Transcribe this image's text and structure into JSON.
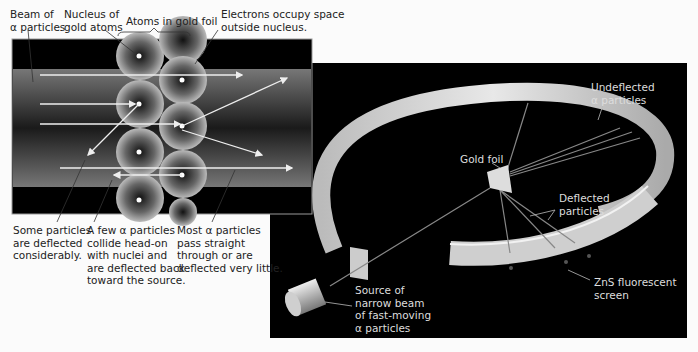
{
  "left_panel": {
    "labels": {
      "beam": "Beam of\nα particles",
      "nucleus": "Nucleus of\ngold atoms",
      "atoms": "Atoms in gold foil",
      "electrons": "Electrons occupy space\noutside nucleus.",
      "some_deflected": "Some particles\nare deflected\nconsiderably.",
      "few_collide": "A few α particles\ncollide head-on\nwith nuclei and\nare deflected back\ntoward the source.",
      "most_pass": "Most α particles\npass straight\nthrough or are\ndeflected very little."
    }
  },
  "right_panel": {
    "labels": {
      "undeflected": "Undeflected\nα particles",
      "gold_foil": "Gold foil",
      "deflected": "Deflected\nparticles",
      "zns_screen": "ZnS fluorescent\nscreen",
      "source": "Source of\nnarrow beam\nof fast-moving\nα particles"
    }
  },
  "colors": {
    "panel_bg": "#000000",
    "page_bg": "#fbfbfb",
    "ring": "#d8d8d8"
  }
}
